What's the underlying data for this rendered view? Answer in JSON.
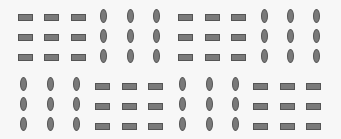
{
  "colors": {
    "background": "#f7f7f7",
    "fill": "#7a7a7a",
    "stroke": "#555555"
  },
  "grid": {
    "blocks": [
      {
        "id": "top-left-a",
        "shape": "rect",
        "cols": [
          18,
          44,
          71
        ],
        "rows": [
          14,
          34,
          54
        ]
      },
      {
        "id": "top-left-b",
        "shape": "oval",
        "cols": [
          100,
          127,
          153
        ],
        "rows": [
          9,
          29,
          49
        ]
      },
      {
        "id": "top-right-a",
        "shape": "rect",
        "cols": [
          178,
          205,
          231
        ],
        "rows": [
          14,
          34,
          54
        ]
      },
      {
        "id": "top-right-b",
        "shape": "oval",
        "cols": [
          261,
          287,
          313
        ],
        "rows": [
          9,
          29,
          49
        ]
      },
      {
        "id": "bottom-left-a",
        "shape": "oval",
        "cols": [
          20,
          47,
          73
        ],
        "rows": [
          77,
          97,
          117
        ]
      },
      {
        "id": "bottom-left-b",
        "shape": "rect",
        "cols": [
          95,
          122,
          148
        ],
        "rows": [
          83,
          103,
          123
        ]
      },
      {
        "id": "bottom-right-a",
        "shape": "oval",
        "cols": [
          179,
          206,
          232
        ],
        "rows": [
          77,
          97,
          117
        ]
      },
      {
        "id": "bottom-right-b",
        "shape": "rect",
        "cols": [
          253,
          280,
          306
        ],
        "rows": [
          83,
          103,
          123
        ]
      }
    ]
  }
}
